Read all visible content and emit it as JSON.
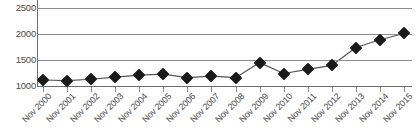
{
  "chart_data": {
    "type": "line",
    "title": "",
    "subtitle": "",
    "xlabel": "",
    "ylabel": "",
    "ylim": [
      1000,
      2500
    ],
    "ytick_labels": [
      "2500",
      "2000",
      "1500",
      "1000"
    ],
    "ytick_values": [
      2500,
      2000,
      1500,
      1000
    ],
    "grid": true,
    "legend": null,
    "legend_position": "none",
    "marker": "diamond",
    "line_color": "#555555",
    "marker_color": "#1a1a1a",
    "grid_color": "#8c8c8c",
    "categories": [
      "Nov 2000",
      "Nov 2001",
      "Nov 2002",
      "Nov 2003",
      "Nov 2004",
      "Nov 2005",
      "Nov 2006",
      "Nov 2007",
      "Nov 2008",
      "Nov 2009",
      "Nov 2010",
      "Nov 2011",
      "Nov 2012",
      "Nov 2013",
      "Nov 2014",
      "Nov 2015"
    ],
    "values": [
      1115,
      1105,
      1130,
      1170,
      1210,
      1230,
      1160,
      1190,
      1160,
      1450,
      1240,
      1320,
      1395,
      1740,
      1890,
      2010
    ]
  }
}
